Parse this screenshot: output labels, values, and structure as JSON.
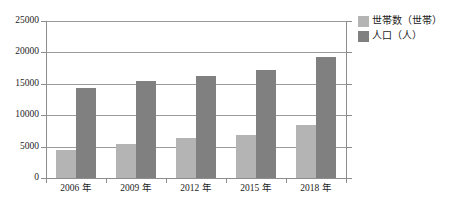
{
  "chart_data": {
    "type": "bar",
    "title": "",
    "subtitle": "",
    "xlabel": "",
    "ylabel": "",
    "categories": [
      "2006 年",
      "2009 年",
      "2012 年",
      "2015 年",
      "2018 年"
    ],
    "series": [
      {
        "name": "世帯数（世帯）",
        "color": "#b4b4b4",
        "values": [
          4500,
          5400,
          6300,
          6800,
          8500
        ]
      },
      {
        "name": "人口（人）",
        "color": "#808080",
        "values": [
          14300,
          15500,
          16300,
          17200,
          19300
        ]
      }
    ],
    "ylim": [
      0,
      25000
    ],
    "yticks": [
      0,
      5000,
      10000,
      15000,
      20000,
      25000
    ],
    "ytick_labels": [
      "0",
      "5000",
      "10000",
      "15000",
      "20000",
      "25000"
    ],
    "grid": true,
    "legend_position": "right-top"
  },
  "legend": {
    "items": [
      {
        "label": "世帯数（世帯）",
        "swatch": "households"
      },
      {
        "label": "人口（人）",
        "swatch": "population"
      }
    ]
  }
}
